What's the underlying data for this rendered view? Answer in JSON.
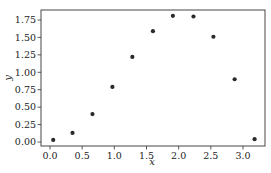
{
  "chart_data": {
    "type": "scatter",
    "title": "",
    "xlabel": "x",
    "ylabel": "y",
    "xlim": [
      -0.1,
      3.35
    ],
    "ylim": [
      -0.06,
      1.89
    ],
    "xticks": [
      0.0,
      0.5,
      1.0,
      1.5,
      2.0,
      2.5,
      3.0
    ],
    "xtick_labels": [
      "0.0",
      "0.5",
      "1.0",
      "1.5",
      "2.0",
      "2.5",
      "3.0"
    ],
    "yticks": [
      0.0,
      0.25,
      0.5,
      0.75,
      1.0,
      1.25,
      1.5,
      1.75
    ],
    "ytick_labels": [
      "0.00",
      "0.25",
      "0.50",
      "0.75",
      "1.00",
      "1.25",
      "1.50",
      "1.75"
    ],
    "grid": false,
    "legend": null,
    "marker_color": "#2a2a2a",
    "series": [
      {
        "name": "data",
        "x": [
          0.05,
          0.35,
          0.66,
          0.97,
          1.28,
          1.6,
          1.91,
          2.23,
          2.54,
          2.87,
          3.18
        ],
        "y": [
          0.03,
          0.13,
          0.4,
          0.79,
          1.22,
          1.59,
          1.81,
          1.8,
          1.51,
          0.9,
          0.04
        ]
      }
    ]
  }
}
